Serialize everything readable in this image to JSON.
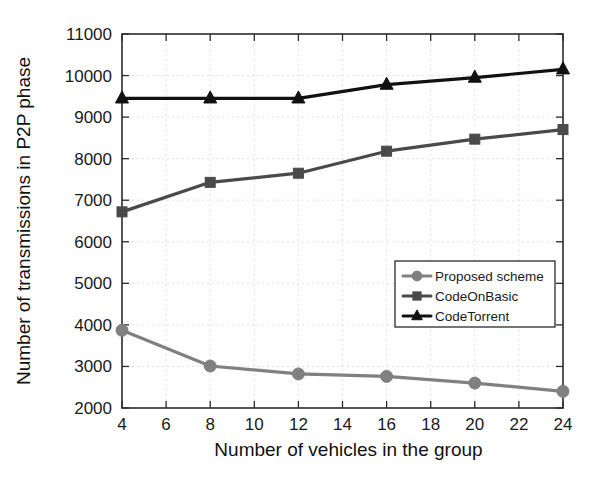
{
  "chart_data": {
    "type": "line",
    "title": "",
    "xlabel": "Number of vehicles in the group",
    "ylabel": "Number of transmissions in P2P phase",
    "x": [
      4,
      8,
      12,
      16,
      20,
      24
    ],
    "xlim": [
      4,
      24
    ],
    "ylim": [
      2000,
      11000
    ],
    "xticks": [
      4,
      6,
      8,
      10,
      12,
      14,
      16,
      18,
      20,
      22,
      24
    ],
    "yticks": [
      2000,
      3000,
      4000,
      5000,
      6000,
      7000,
      8000,
      9000,
      10000,
      11000
    ],
    "grid": true,
    "legend_position": "center-right",
    "series": [
      {
        "name": "Proposed scheme",
        "marker": "circle",
        "color": "#808080",
        "values": [
          3870,
          3010,
          2820,
          2760,
          2600,
          2400
        ]
      },
      {
        "name": "CodeOnBasic",
        "marker": "square",
        "color": "#4a4a4a",
        "values": [
          6720,
          7430,
          7650,
          8180,
          8470,
          8700
        ]
      },
      {
        "name": "CodeTorrent",
        "marker": "triangle",
        "color": "#111111",
        "values": [
          9450,
          9450,
          9450,
          9780,
          9950,
          10150
        ]
      }
    ]
  },
  "axes": {
    "x_tick_labels": [
      "4",
      "6",
      "8",
      "10",
      "12",
      "14",
      "16",
      "18",
      "20",
      "22",
      "24"
    ],
    "y_tick_labels": [
      "2000",
      "3000",
      "4000",
      "5000",
      "6000",
      "7000",
      "8000",
      "9000",
      "10000",
      "11000"
    ],
    "x_axis_title": "Number of vehicles in the group",
    "y_axis_title": "Number of transmissions in P2P phase"
  },
  "legend": {
    "entries": [
      {
        "label": "Proposed scheme"
      },
      {
        "label": "CodeOnBasic"
      },
      {
        "label": "CodeTorrent"
      }
    ]
  }
}
